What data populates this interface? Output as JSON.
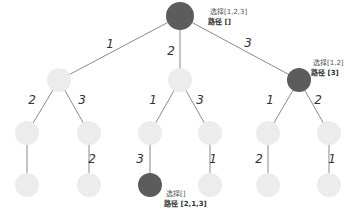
{
  "diagram": {
    "colors": {
      "visited": "#5c5c5c",
      "unvisited": "#ececec",
      "edge": "#8a8a8a"
    },
    "nodes": [
      {
        "id": "root",
        "x": 180,
        "y": 16,
        "r": 14,
        "state": "dark"
      },
      {
        "id": "n1",
        "x": 59,
        "y": 80,
        "r": 12,
        "state": "light"
      },
      {
        "id": "n2",
        "x": 180,
        "y": 80,
        "r": 12,
        "state": "light"
      },
      {
        "id": "n3",
        "x": 299,
        "y": 80,
        "r": 12,
        "state": "dark"
      },
      {
        "id": "n12",
        "x": 27,
        "y": 133,
        "r": 12,
        "state": "light"
      },
      {
        "id": "n13",
        "x": 89,
        "y": 133,
        "r": 12,
        "state": "light"
      },
      {
        "id": "n21",
        "x": 150,
        "y": 133,
        "r": 12,
        "state": "light"
      },
      {
        "id": "n23",
        "x": 210,
        "y": 133,
        "r": 12,
        "state": "light"
      },
      {
        "id": "n31",
        "x": 268,
        "y": 133,
        "r": 12,
        "state": "light"
      },
      {
        "id": "n32",
        "x": 329,
        "y": 133,
        "r": 12,
        "state": "light"
      },
      {
        "id": "n123",
        "x": 27,
        "y": 185,
        "r": 12,
        "state": "light"
      },
      {
        "id": "n132",
        "x": 89,
        "y": 185,
        "r": 12,
        "state": "light"
      },
      {
        "id": "n213",
        "x": 150,
        "y": 185,
        "r": 12,
        "state": "dark"
      },
      {
        "id": "n231",
        "x": 210,
        "y": 185,
        "r": 12,
        "state": "light"
      },
      {
        "id": "n312",
        "x": 268,
        "y": 185,
        "r": 12,
        "state": "light"
      },
      {
        "id": "n321",
        "x": 329,
        "y": 185,
        "r": 12,
        "state": "light"
      }
    ],
    "edges": [
      {
        "from": "root",
        "to": "n1",
        "label": "1",
        "lx": 110,
        "ly": 48
      },
      {
        "from": "root",
        "to": "n2",
        "label": "2",
        "lx": 171,
        "ly": 55
      },
      {
        "from": "root",
        "to": "n3",
        "label": "3",
        "lx": 248,
        "ly": 47
      },
      {
        "from": "n1",
        "to": "n12",
        "label": "2",
        "lx": 32,
        "ly": 104
      },
      {
        "from": "n1",
        "to": "n13",
        "label": "3",
        "lx": 82,
        "ly": 104
      },
      {
        "from": "n2",
        "to": "n21",
        "label": "1",
        "lx": 153,
        "ly": 104
      },
      {
        "from": "n2",
        "to": "n23",
        "label": "3",
        "lx": 200,
        "ly": 104
      },
      {
        "from": "n3",
        "to": "n31",
        "label": "1",
        "lx": 270,
        "ly": 104
      },
      {
        "from": "n3",
        "to": "n32",
        "label": "2",
        "lx": 318,
        "ly": 104
      },
      {
        "from": "n12",
        "to": "n123",
        "label": "",
        "lx": 0,
        "ly": 0
      },
      {
        "from": "n13",
        "to": "n132",
        "label": "2",
        "lx": 92,
        "ly": 163
      },
      {
        "from": "n21",
        "to": "n213",
        "label": "3",
        "lx": 140,
        "ly": 163
      },
      {
        "from": "n23",
        "to": "n231",
        "label": "1",
        "lx": 213,
        "ly": 163
      },
      {
        "from": "n31",
        "to": "n312",
        "label": "2",
        "lx": 259,
        "ly": 163
      },
      {
        "from": "n32",
        "to": "n321",
        "label": "1",
        "lx": 332,
        "ly": 163
      }
    ],
    "annotations": [
      {
        "id": "root-anno",
        "x": 210,
        "y": 14,
        "choices": "选择[1,2,3]",
        "path": "路径 []"
      },
      {
        "id": "n3-anno",
        "x": 313,
        "y": 65,
        "choices": "选择[1,2]",
        "path": "路径 [3]"
      },
      {
        "id": "leaf-anno",
        "x": 166,
        "y": 196,
        "choices": "选择[]",
        "path": "路径 [2,1,3]"
      }
    ]
  }
}
